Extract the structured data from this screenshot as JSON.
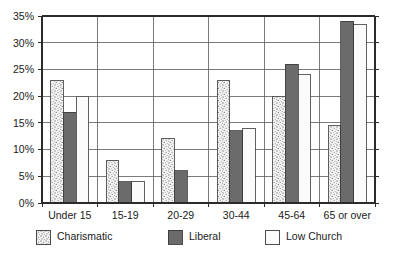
{
  "chart_data": {
    "type": "bar",
    "title": "",
    "subtitle": "",
    "xlabel": "",
    "ylabel": "",
    "categories": [
      "Under 15",
      "15-19",
      "20-29",
      "30-44",
      "45-64",
      "65 or over"
    ],
    "series": [
      {
        "name": "Charismatic",
        "values": [
          23,
          8,
          12,
          23,
          20,
          14.5
        ],
        "fill": "stipple",
        "color": "#e8e8e8"
      },
      {
        "name": "Liberal",
        "values": [
          17,
          4,
          6,
          13.5,
          26,
          34
        ],
        "fill": "solid",
        "color": "#6b6b6b"
      },
      {
        "name": "Low Church",
        "values": [
          20,
          4,
          0,
          14,
          24,
          33.5
        ],
        "fill": "empty",
        "color": "#fbfbfb"
      }
    ],
    "ylim": [
      0,
      35
    ],
    "ytick_values": [
      0,
      5,
      10,
      15,
      20,
      25,
      30,
      35
    ],
    "ytick_labels": [
      "0%",
      "5%",
      "10%",
      "15%",
      "20%",
      "25%",
      "30%",
      "35%"
    ],
    "grid": true,
    "grid_axis": "y",
    "legend_position": "bottom",
    "legend_entries": [
      "Charismatic",
      "Liberal",
      "Low Church"
    ],
    "axis_color": "#2b2b2b",
    "grid_color": "#5a5a5a",
    "background": "#ffffff"
  }
}
